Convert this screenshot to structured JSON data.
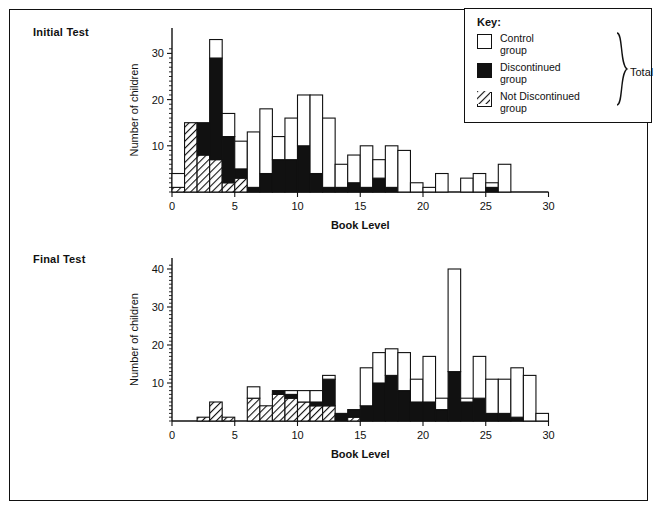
{
  "figure": {
    "panels": [
      {
        "id": "initial",
        "title": "Initial Test"
      },
      {
        "id": "final",
        "title": "Final Test"
      }
    ]
  },
  "key": {
    "title": "Key:",
    "items": [
      {
        "swatch": "open-square",
        "line1": "Control",
        "line2": "group",
        "color": "#ffffff"
      },
      {
        "swatch": "filled-square",
        "line1": "Discontinued",
        "line2": "group",
        "color": "#111111"
      },
      {
        "swatch": "hatched-square",
        "line1": "Not Discontinued",
        "line2": "group",
        "color": "#ffffff"
      }
    ],
    "brace_label": "Total",
    "brace_icon": "right-curly-brace-icon"
  },
  "chart_data": [
    {
      "type": "bar",
      "id": "initial-test",
      "title": "Initial Test",
      "xlabel": "Book Level",
      "ylabel": "Number of children",
      "xlim": [
        0,
        30
      ],
      "ylim": [
        0,
        34
      ],
      "xticks": [
        0,
        5,
        10,
        15,
        20,
        25,
        30
      ],
      "yticks": [
        10,
        20,
        30
      ],
      "grid": false,
      "stacked": true,
      "bin_width": 1,
      "bin_starts": [
        0,
        1,
        2,
        3,
        4,
        5,
        6,
        7,
        8,
        9,
        10,
        11,
        12,
        13,
        14,
        15,
        16,
        17,
        18,
        19,
        20,
        21,
        22,
        23,
        24,
        25,
        26
      ],
      "series": [
        {
          "name": "Not Discontinued group",
          "values": [
            1,
            15,
            8,
            7,
            2,
            3,
            0,
            0,
            0,
            0,
            0,
            0,
            0,
            0,
            0,
            0,
            0,
            0,
            0,
            0,
            0,
            0,
            0,
            0,
            0,
            0,
            0
          ]
        },
        {
          "name": "Discontinued group",
          "values": [
            0,
            0,
            7,
            22,
            10,
            2,
            1,
            4,
            7,
            7,
            10,
            4,
            1,
            1,
            2,
            1,
            3,
            1,
            0,
            0,
            0,
            0,
            0,
            0,
            0,
            1,
            0
          ]
        },
        {
          "name": "Control group",
          "values": [
            3,
            0,
            0,
            4,
            5,
            6,
            12,
            14,
            5,
            9,
            11,
            17,
            15,
            5,
            6,
            9,
            4,
            9,
            9,
            2,
            1,
            4,
            0,
            3,
            4,
            1,
            6
          ]
        }
      ],
      "totals": [
        4,
        15,
        15,
        33,
        17,
        11,
        13,
        18,
        12,
        16,
        21,
        21,
        16,
        6,
        8,
        10,
        7,
        10,
        9,
        2,
        1,
        4,
        0,
        3,
        4,
        2,
        6
      ]
    },
    {
      "type": "bar",
      "id": "final-test",
      "title": "Final Test",
      "xlabel": "Book Level",
      "ylabel": "Number of children",
      "xlim": [
        0,
        30
      ],
      "ylim": [
        0,
        41
      ],
      "xticks": [
        0,
        5,
        10,
        15,
        20,
        25,
        30
      ],
      "yticks": [
        10,
        20,
        30,
        40
      ],
      "grid": false,
      "stacked": true,
      "bin_width": 1,
      "bin_starts": [
        2,
        3,
        4,
        5,
        6,
        7,
        8,
        9,
        10,
        11,
        12,
        13,
        14,
        15,
        16,
        17,
        18,
        19,
        20,
        21,
        22,
        23,
        24,
        25,
        26,
        27,
        28,
        29
      ],
      "series": [
        {
          "name": "Not Discontinued group",
          "values": [
            1,
            5,
            1,
            0,
            6,
            4,
            7,
            6,
            5,
            4,
            4,
            0,
            1,
            0,
            0,
            0,
            0,
            0,
            0,
            0,
            0,
            0,
            0,
            0,
            0,
            0,
            0,
            0
          ]
        },
        {
          "name": "Discontinued group",
          "values": [
            0,
            0,
            0,
            0,
            0,
            0,
            1,
            1,
            0,
            1,
            7,
            2,
            2,
            4,
            10,
            12,
            8,
            5,
            5,
            3,
            13,
            5,
            6,
            2,
            2,
            1,
            0,
            0
          ]
        },
        {
          "name": "Control group",
          "values": [
            0,
            0,
            0,
            0,
            3,
            0,
            0,
            1,
            3,
            3,
            1,
            0,
            0,
            10,
            8,
            7,
            10,
            6,
            12,
            3,
            27,
            1,
            11,
            9,
            9,
            13,
            12,
            2
          ]
        }
      ],
      "totals": [
        1,
        5,
        1,
        0,
        9,
        4,
        8,
        8,
        8,
        8,
        12,
        2,
        3,
        14,
        18,
        19,
        18,
        11,
        17,
        6,
        40,
        6,
        17,
        11,
        11,
        14,
        12,
        2
      ]
    }
  ]
}
